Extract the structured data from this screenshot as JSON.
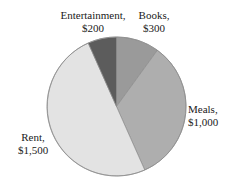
{
  "chart_data": {
    "type": "pie",
    "title": "",
    "subtitle": "",
    "xlabel": "",
    "ylabel": "",
    "total": 3000,
    "currency": "$",
    "start_angle_deg": 0,
    "direction": "clockwise",
    "legend_position": "none",
    "labels_outside": true,
    "grid": false,
    "categories": [
      "Books",
      "Meals",
      "Rent",
      "Entertainment"
    ],
    "values": [
      300,
      1000,
      1500,
      200
    ],
    "slices": [
      {
        "name": "Books",
        "label_name": "Books,",
        "label_value": "$300",
        "value": 300,
        "percent": 10,
        "angle_deg": 36,
        "start_deg": 0,
        "end_deg": 36,
        "color": "#9a9a9a"
      },
      {
        "name": "Meals",
        "label_name": "Meals,",
        "label_value": "$1,000",
        "value": 1000,
        "percent": 33.3,
        "angle_deg": 120,
        "start_deg": 36,
        "end_deg": 156,
        "color": "#aeaeae"
      },
      {
        "name": "Rent",
        "label_name": "Rent,",
        "label_value": "$1,500",
        "value": 1500,
        "percent": 50,
        "angle_deg": 180,
        "start_deg": 156,
        "end_deg": 336,
        "color": "#e3e3e3"
      },
      {
        "name": "Entertainment",
        "label_name": "Entertainment,",
        "label_value": "$200",
        "value": 200,
        "percent": 6.7,
        "angle_deg": 24,
        "start_deg": 336,
        "end_deg": 360,
        "color": "#5c5c5c"
      }
    ],
    "geometry": {
      "center_x": 116.5,
      "center_y": 106.5,
      "radius": 69.5
    },
    "background_color": "#ffffff",
    "outline_color": "#8d8d8d"
  }
}
